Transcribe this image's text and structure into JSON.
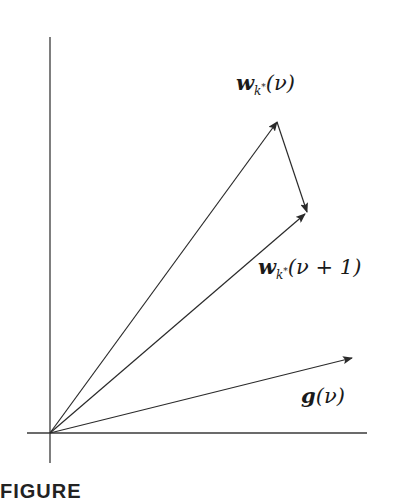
{
  "diagram": {
    "type": "vector-diagram",
    "origin": [
      50,
      433
    ],
    "axes": {
      "vertical": {
        "x": 50,
        "y_top": 37,
        "y_bottom": 463
      },
      "horizontal": {
        "y": 433,
        "x_left": 27,
        "x_right": 367
      }
    },
    "vectors": [
      {
        "id": "w_k_star_nu",
        "from": [
          50,
          433
        ],
        "to": [
          277,
          122
        ]
      },
      {
        "id": "w_k_star_nu_plus_1",
        "from": [
          50,
          433
        ],
        "to": [
          305,
          214
        ]
      },
      {
        "id": "update",
        "from": [
          277,
          122
        ],
        "to": [
          307,
          214
        ]
      },
      {
        "id": "g_nu",
        "from": [
          50,
          433
        ],
        "to": [
          352,
          358
        ]
      }
    ],
    "stroke_color": "#2a2a2a"
  },
  "labels": {
    "wk": {
      "base": "w",
      "sub": "k",
      "sup": "*",
      "arg": "(ν)"
    },
    "wk1": {
      "base": "w",
      "sub": "k",
      "sup": "*",
      "arg": "(ν + 1)"
    },
    "g": {
      "base": "g",
      "arg": "(ν)"
    }
  },
  "caption": {
    "text": "FIGURE"
  }
}
